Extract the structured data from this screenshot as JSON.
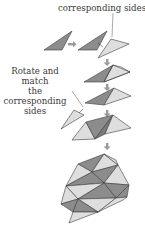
{
  "diagram": {
    "labels": {
      "top": "corresponding sides",
      "side_line1": "Rotate and match",
      "side_line2": "the corresponding",
      "side_line3": "sides"
    },
    "colors": {
      "dark_triangle": "#8c8c8c",
      "light_triangle": "#dedede",
      "stroke": "#3c3c3c",
      "arrow": "#9a9a9a",
      "text": "#3a3a3a"
    },
    "steps": [
      {
        "name": "single-triangle"
      },
      {
        "name": "triangle-and-rotated-copy"
      },
      {
        "name": "matched-pair"
      },
      {
        "name": "pair-plus-triangle"
      },
      {
        "name": "strip-of-triangles"
      },
      {
        "name": "tessellation"
      }
    ]
  }
}
